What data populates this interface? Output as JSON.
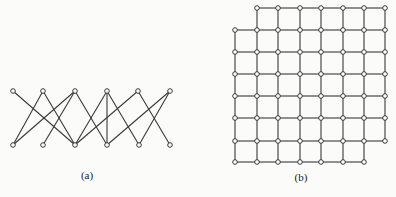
{
  "figure": {
    "colors": {
      "background": "#fbfbfa",
      "edge": "#3a3a3a",
      "node_stroke": "#3a3a3a",
      "node_fill": "#ffffff",
      "label": "#222222"
    },
    "panels": [
      {
        "id": "a",
        "label": "(a)",
        "label_pos": [
          87,
          179
        ],
        "type": "bipartite-graph",
        "nodes": {
          "top": [
            [
              13,
              91
            ],
            [
              43,
              91
            ],
            [
              75,
              91
            ],
            [
              107,
              91
            ],
            [
              138,
              91
            ],
            [
              170,
              91
            ]
          ],
          "bottom": [
            [
              13,
              145
            ],
            [
              43,
              145
            ],
            [
              75,
              145
            ],
            [
              107,
              145
            ],
            [
              139,
              145
            ],
            [
              170,
              145
            ]
          ]
        },
        "edges": [
          [
            "T1",
            "B3"
          ],
          [
            "T2",
            "B1"
          ],
          [
            "T2",
            "B3"
          ],
          [
            "T3",
            "B1"
          ],
          [
            "T3",
            "B2"
          ],
          [
            "T3",
            "B4"
          ],
          [
            "T4",
            "B3"
          ],
          [
            "T4",
            "B4"
          ],
          [
            "T4",
            "B5"
          ],
          [
            "T5",
            "B3"
          ],
          [
            "T5",
            "B6"
          ],
          [
            "T6",
            "B4"
          ],
          [
            "T6",
            "B5"
          ]
        ]
      },
      {
        "id": "b",
        "label": "(b)",
        "label_pos": [
          301,
          181
        ],
        "type": "grid-graph",
        "columns_x": [
          235,
          257,
          278,
          300,
          321,
          343,
          364,
          385
        ],
        "rows_y": [
          8,
          30,
          52,
          74,
          96,
          118,
          141,
          162
        ],
        "missing_nodes": [
          [
            0,
            0
          ],
          [
            7,
            7
          ]
        ]
      }
    ]
  }
}
